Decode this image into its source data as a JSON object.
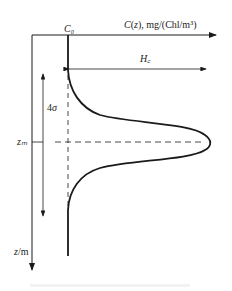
{
  "diagram": {
    "type": "gaussian-chlorophyll-profile",
    "labels": {
      "x_axis": "C(z), mg/(Chl/m³)",
      "baseline": "C₀",
      "peak_height": "H꜀",
      "width": "4σ",
      "peak_depth": "zₘ",
      "y_axis": "z/m"
    },
    "colors": {
      "line": "#1a1a1a",
      "background": "#ffffff"
    }
  }
}
